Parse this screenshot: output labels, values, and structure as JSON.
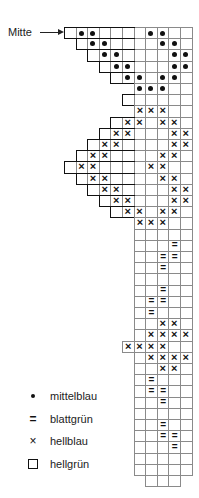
{
  "chart": {
    "title": "",
    "marker_label": "Mitte",
    "grid": {
      "origin_x": 64,
      "origin_y": 27,
      "cell_w": 11.6,
      "cell_h": 11.2,
      "main_col_start": 6,
      "main_col_end": 10
    },
    "rows": [
      {
        "start": 0,
        "end": 10,
        "dot": [
          1,
          2,
          7,
          8
        ],
        "cross": [],
        "eq": [],
        "step": true
      },
      {
        "start": 1,
        "end": 10,
        "dot": [
          2,
          3,
          8,
          9
        ],
        "cross": [],
        "eq": [],
        "step": true
      },
      {
        "start": 2,
        "end": 10,
        "dot": [
          3,
          4,
          9,
          10
        ],
        "cross": [],
        "eq": [],
        "step": true
      },
      {
        "start": 3,
        "end": 10,
        "dot": [
          4,
          5,
          9,
          10
        ],
        "cross": [],
        "eq": [],
        "step": true
      },
      {
        "start": 4,
        "end": 10,
        "dot": [
          5,
          6,
          8,
          9
        ],
        "cross": [],
        "eq": [],
        "step": true
      },
      {
        "start": 6,
        "end": 10,
        "dot": [
          6,
          7,
          8
        ],
        "cross": [],
        "eq": [],
        "step": false
      },
      {
        "start": 5,
        "end": 10,
        "dot": [],
        "cross": [],
        "eq": [],
        "step": true
      },
      {
        "start": 6,
        "end": 10,
        "dot": [],
        "cross": [
          6,
          7,
          8
        ],
        "eq": [],
        "step": false
      },
      {
        "start": 4,
        "end": 10,
        "dot": [],
        "cross": [
          5,
          6,
          8,
          9
        ],
        "eq": [],
        "step": true
      },
      {
        "start": 3,
        "end": 10,
        "dot": [],
        "cross": [
          4,
          5,
          9,
          10
        ],
        "eq": [],
        "step": true
      },
      {
        "start": 2,
        "end": 10,
        "dot": [],
        "cross": [
          3,
          4,
          9,
          10
        ],
        "eq": [],
        "step": true
      },
      {
        "start": 1,
        "end": 10,
        "dot": [],
        "cross": [
          2,
          3,
          8,
          9
        ],
        "eq": [],
        "step": true
      },
      {
        "start": 0,
        "end": 10,
        "dot": [],
        "cross": [
          1,
          2,
          7,
          8
        ],
        "eq": [],
        "step": true
      },
      {
        "start": 1,
        "end": 10,
        "dot": [],
        "cross": [
          2,
          3,
          8,
          9
        ],
        "eq": [],
        "step": true
      },
      {
        "start": 2,
        "end": 10,
        "dot": [],
        "cross": [
          3,
          4,
          9,
          10
        ],
        "eq": [],
        "step": true
      },
      {
        "start": 3,
        "end": 10,
        "dot": [],
        "cross": [
          4,
          5,
          9,
          10
        ],
        "eq": [],
        "step": true
      },
      {
        "start": 4,
        "end": 10,
        "dot": [],
        "cross": [
          5,
          6,
          8,
          9
        ],
        "eq": [],
        "step": true
      },
      {
        "start": 6,
        "end": 10,
        "dot": [],
        "cross": [
          6,
          7,
          8
        ],
        "eq": [],
        "step": false
      },
      {
        "start": 6,
        "end": 10,
        "dot": [],
        "cross": [],
        "eq": [],
        "step": false
      },
      {
        "start": 6,
        "end": 10,
        "dot": [],
        "cross": [],
        "eq": [
          9
        ],
        "step": false
      },
      {
        "start": 6,
        "end": 10,
        "dot": [],
        "cross": [],
        "eq": [
          8,
          9
        ],
        "step": false
      },
      {
        "start": 6,
        "end": 10,
        "dot": [],
        "cross": [],
        "eq": [
          8
        ],
        "step": false
      },
      {
        "start": 6,
        "end": 10,
        "dot": [],
        "cross": [],
        "eq": [],
        "step": false
      },
      {
        "start": 6,
        "end": 10,
        "dot": [],
        "cross": [],
        "eq": [
          8
        ],
        "step": false
      },
      {
        "start": 6,
        "end": 10,
        "dot": [],
        "cross": [],
        "eq": [
          7,
          8
        ],
        "step": false
      },
      {
        "start": 6,
        "end": 10,
        "dot": [],
        "cross": [],
        "eq": [
          7
        ],
        "step": false
      },
      {
        "start": 6,
        "end": 10,
        "dot": [],
        "cross": [
          8,
          9
        ],
        "eq": [],
        "step": false
      },
      {
        "start": 6,
        "end": 10,
        "dot": [],
        "cross": [
          7,
          8,
          9,
          10
        ],
        "eq": [],
        "step": false
      },
      {
        "start": 5,
        "end": 10,
        "dot": [],
        "cross": [
          5,
          6,
          7,
          8
        ],
        "eq": [],
        "step": false
      },
      {
        "start": 6,
        "end": 10,
        "dot": [],
        "cross": [
          7,
          8,
          9,
          10
        ],
        "eq": [],
        "step": false
      },
      {
        "start": 6,
        "end": 10,
        "dot": [],
        "cross": [
          8,
          9
        ],
        "eq": [],
        "step": false
      },
      {
        "start": 6,
        "end": 10,
        "dot": [],
        "cross": [],
        "eq": [
          7
        ],
        "step": false
      },
      {
        "start": 6,
        "end": 10,
        "dot": [],
        "cross": [],
        "eq": [
          7,
          8
        ],
        "step": false
      },
      {
        "start": 6,
        "end": 10,
        "dot": [],
        "cross": [],
        "eq": [
          8
        ],
        "step": false
      },
      {
        "start": 6,
        "end": 10,
        "dot": [],
        "cross": [],
        "eq": [],
        "step": false
      },
      {
        "start": 6,
        "end": 10,
        "dot": [],
        "cross": [],
        "eq": [
          8
        ],
        "step": false
      },
      {
        "start": 6,
        "end": 10,
        "dot": [],
        "cross": [],
        "eq": [
          8,
          9
        ],
        "step": false
      },
      {
        "start": 6,
        "end": 10,
        "dot": [],
        "cross": [],
        "eq": [
          9
        ],
        "step": false
      },
      {
        "start": 6,
        "end": 10,
        "dot": [],
        "cross": [],
        "eq": [],
        "step": false
      },
      {
        "start": 6,
        "end": 10,
        "dot": [],
        "cross": [],
        "eq": [],
        "step": false
      },
      {
        "start": 7,
        "end": 9,
        "dot": [],
        "cross": [],
        "eq": [],
        "step": false
      }
    ]
  },
  "legend": {
    "items": [
      {
        "symbol": "dot",
        "icon": "dot-icon",
        "label": "mittelblau"
      },
      {
        "symbol": "eq",
        "icon": "double-line-icon",
        "label": "blattgrün"
      },
      {
        "symbol": "cross",
        "icon": "cross-icon",
        "label": "hellblau"
      },
      {
        "symbol": "box",
        "icon": "empty-square-icon",
        "label": "hellgrün"
      }
    ],
    "glyphs": {
      "cross": "×",
      "eq": "="
    }
  },
  "colors": {
    "line": "#8a8a8a",
    "ink": "#111111",
    "background": "#ffffff"
  }
}
